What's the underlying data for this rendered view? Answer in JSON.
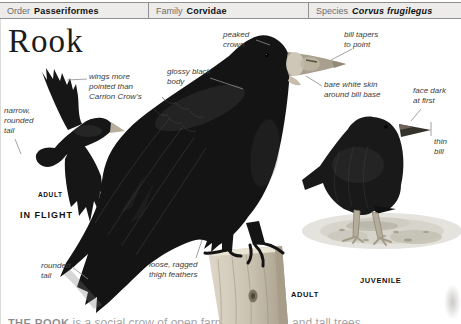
{
  "header": {
    "cells": [
      {
        "label": "Order",
        "value": "Passeriformes"
      },
      {
        "label": "Family",
        "value": "Corvidae"
      },
      {
        "label": "Species",
        "value": "Corvus frugilegus"
      }
    ]
  },
  "title": "Rook",
  "figures": {
    "in_flight": {
      "caption": "IN FLIGHT",
      "age_label": "ADULT",
      "annotations": {
        "wings": "wings more\npointed than\nCarrion Crow's",
        "tail": "narrow,\nrounded\ntail"
      }
    },
    "adult": {
      "age_label": "ADULT",
      "annotations": {
        "peaked_crown": "peaked\ncrown",
        "glossy_body": "glossy black\nbody",
        "bill_tapers": "bill tapers\nto point",
        "bare_skin": "bare white skin\naround bill base",
        "thigh_feathers": "loose, ragged\nthigh feathers",
        "rounded_tail": "rounded\ntail"
      }
    },
    "juvenile": {
      "age_label": "JUVENILE",
      "annotations": {
        "face": "face dark\nat first",
        "thin_bill": "thin\nbill"
      }
    }
  },
  "bottom_text": {
    "lead": "THE ROOK",
    "rest": " is a social crow of open farmland, woods and tall trees"
  },
  "colors": {
    "header_bg": "#edecea",
    "header_border": "#8f8f8f",
    "annotation_text": "#3b3b3b",
    "label_text": "#111111",
    "bird_black": "#141414",
    "bill_gray": "#a89f8e",
    "post_wood": "#c9c1b0"
  }
}
